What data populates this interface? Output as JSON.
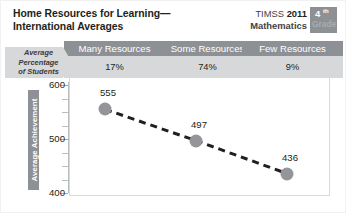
{
  "header": {
    "title_line1": "Home Resources for Learning—",
    "title_line2": "International Averages",
    "timss_name": "TIMSS",
    "timss_year": "2011",
    "subject": "Mathematics",
    "grade_number": "4",
    "grade_suffix": "th",
    "grade_word": "Grade"
  },
  "band": {
    "row_label_line1": "Average",
    "row_label_line2": "Percentage",
    "row_label_line3": "of Students",
    "categories": [
      {
        "label": "Many Resources",
        "percent": "17%"
      },
      {
        "label": "Some Resources",
        "percent": "74%"
      },
      {
        "label": "Few Resources",
        "percent": "9%"
      }
    ]
  },
  "chart_data": {
    "type": "line",
    "title": "Home Resources for Learning— International Averages",
    "xlabel": "",
    "ylabel": "Average Achievement",
    "categories": [
      "Many Resources",
      "Some Resources",
      "Few Resources"
    ],
    "values": [
      555,
      497,
      436
    ],
    "percent_of_students": [
      17,
      74,
      9
    ],
    "ylim": [
      400,
      600
    ],
    "yticks": [
      "600",
      "500",
      "400"
    ],
    "minor_tick_step": 25,
    "grid": false,
    "legend": "none",
    "marker_color": "#939598",
    "line_style": "dashed",
    "line_color": "#231f20"
  },
  "colors": {
    "header_gray": "#8d9094",
    "value_gray": "#d6d8da",
    "marker_gray": "#939598",
    "text_dark": "#231f20",
    "frame_gray": "#d7d9db"
  }
}
